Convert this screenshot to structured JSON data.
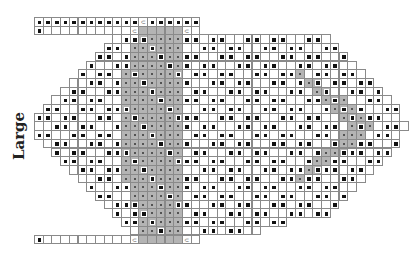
{
  "label": "Large",
  "grid": {
    "origin_x": 34,
    "origin_y": 17,
    "cell": 8.7,
    "rows": [
      {
        "start": 0,
        "end": 18,
        "gray": [],
        "marks": "BBBBBBBBBBBBOBBBBBB"
      },
      {
        "start": 0,
        "end": 18,
        "gray": [
          12,
          13,
          14,
          15,
          16
        ],
        "marks": "B..........O.....O."
      },
      {
        "start": 9,
        "end": 33,
        "gray": [
          12,
          13,
          14,
          15,
          16
        ]
      },
      {
        "start": 8,
        "end": 34,
        "gray": [
          11,
          12,
          13,
          14,
          15,
          16
        ]
      },
      {
        "start": 7,
        "end": 35,
        "gray": [
          11,
          12,
          13,
          14,
          15,
          16
        ]
      },
      {
        "start": 6,
        "end": 36,
        "gray": [
          11,
          12,
          13,
          14,
          15,
          16
        ]
      },
      {
        "start": 5,
        "end": 37,
        "gray": [
          10,
          11,
          12,
          13,
          14,
          15,
          16,
          30
        ]
      },
      {
        "start": 4,
        "end": 38,
        "gray": [
          10,
          11,
          12,
          13,
          14,
          15,
          16,
          31,
          32
        ]
      },
      {
        "start": 3,
        "end": 39,
        "gray": [
          10,
          11,
          12,
          13,
          14,
          15,
          16,
          32,
          33
        ]
      },
      {
        "start": 2,
        "end": 40,
        "gray": [
          10,
          11,
          12,
          13,
          14,
          15,
          16,
          33,
          34,
          35
        ]
      },
      {
        "start": 1,
        "end": 41,
        "gray": [
          10,
          11,
          12,
          13,
          14,
          15,
          16,
          34,
          35,
          36
        ]
      },
      {
        "start": 0,
        "end": 41,
        "gray": [
          10,
          11,
          12,
          13,
          14,
          15,
          16,
          35,
          36,
          37
        ]
      },
      {
        "start": 0,
        "end": 42,
        "gray": [
          10,
          11,
          12,
          13,
          14,
          15,
          16,
          36,
          37,
          38
        ]
      },
      {
        "start": 0,
        "end": 41,
        "gray": [
          10,
          11,
          12,
          13,
          14,
          15,
          16,
          35,
          36,
          37
        ]
      },
      {
        "start": 1,
        "end": 41,
        "gray": [
          10,
          11,
          12,
          13,
          14,
          15,
          16,
          34,
          35,
          36
        ]
      },
      {
        "start": 2,
        "end": 40,
        "gray": [
          10,
          11,
          12,
          13,
          14,
          15,
          16,
          33,
          34,
          35
        ]
      },
      {
        "start": 3,
        "end": 39,
        "gray": [
          10,
          11,
          12,
          13,
          14,
          15,
          16,
          32,
          33
        ]
      },
      {
        "start": 4,
        "end": 38,
        "gray": [
          10,
          11,
          12,
          13,
          14,
          15,
          16,
          31,
          32
        ]
      },
      {
        "start": 5,
        "end": 37,
        "gray": [
          10,
          11,
          12,
          13,
          14,
          15,
          16,
          30
        ]
      },
      {
        "start": 6,
        "end": 36,
        "gray": [
          11,
          12,
          13,
          14,
          15,
          16
        ]
      },
      {
        "start": 7,
        "end": 35,
        "gray": [
          11,
          12,
          13,
          14,
          15,
          16
        ]
      },
      {
        "start": 8,
        "end": 34,
        "gray": [
          11,
          12,
          13,
          14,
          15,
          16
        ]
      },
      {
        "start": 9,
        "end": 33,
        "gray": [
          12,
          13,
          14,
          15,
          16
        ]
      },
      {
        "start": 10,
        "end": 28,
        "gray": [
          12,
          13,
          14,
          15,
          16
        ]
      },
      {
        "start": 11,
        "end": 25,
        "gray": [
          12,
          13,
          14,
          15,
          16
        ]
      },
      {
        "start": 0,
        "end": 18,
        "gray": [
          12,
          13,
          14,
          15,
          16
        ],
        "marks": "B..........O.....O."
      }
    ]
  },
  "legend_symbols": {
    "B": "filled-square",
    "O": "twist-symbol",
    ".": "empty",
    "dot": "small-dot"
  }
}
